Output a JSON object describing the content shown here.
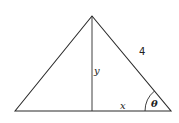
{
  "diagram": {
    "type": "triangle",
    "colors": {
      "stroke": "#2a2a2a",
      "background": "#ffffff"
    },
    "labels": {
      "hypotenuse": "4",
      "altitude": "y",
      "half_base": "x",
      "angle": "θ"
    }
  }
}
